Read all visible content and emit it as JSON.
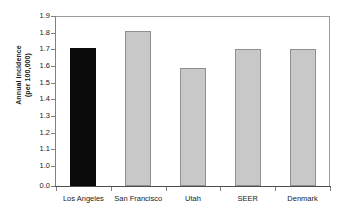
{
  "chart_data": {
    "type": "bar",
    "title": "",
    "subtitle": "",
    "xlabel": "",
    "ylabel_line1": "Annual incidence",
    "ylabel_line2": "(per 100,000)",
    "ylabel": "Annual incidence (per 100,000)",
    "categories": [
      "Los Angeles",
      "San Francisco",
      "Utah",
      "SEER",
      "Denmark"
    ],
    "values": [
      1.71,
      1.81,
      1.59,
      1.7,
      1.7
    ],
    "ylim": [
      0.0,
      1.9
    ],
    "y_tick_labels": [
      "1.9",
      "1.8",
      "1.7",
      "1.6",
      "1.5",
      "1.4",
      "1.3",
      "1.2",
      "1.1",
      "1.0",
      "0.0"
    ],
    "y_tick_values": [
      1.9,
      1.8,
      1.7,
      1.6,
      1.5,
      1.4,
      1.3,
      1.2,
      1.1,
      1.0,
      0.0
    ],
    "axis_break": true,
    "axis_break_note": "Scale jumps from 0.0 directly to 1.0",
    "grid": false,
    "legend": false,
    "legend_position": "none",
    "bar_colors": [
      "#0a0a0a",
      "#c8c8c8",
      "#c8c8c8",
      "#c8c8c8",
      "#c8c8c8"
    ],
    "highlighted_category": "Los Angeles",
    "bar_border_color": "#8f8f8f",
    "axis_color": "#808080",
    "plot_background": "#ffffff"
  }
}
